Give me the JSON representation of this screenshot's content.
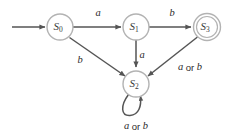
{
  "diagram": {
    "type": "finite-state-machine",
    "title": "",
    "canvas": {
      "width": 231,
      "height": 137,
      "background": "#ffffff"
    },
    "colors": {
      "state_stroke": "#b3b3b3",
      "state_fill": "#ffffff",
      "edge_stroke": "#555555",
      "label_text": "#2b2b2b",
      "state_text": "#3a3a3a"
    },
    "states": [
      {
        "id": "S0",
        "base": "S",
        "subscript": "0",
        "cx": 60,
        "cy": 27,
        "r": 13,
        "accepting": false,
        "start": true
      },
      {
        "id": "S1",
        "base": "S",
        "subscript": "1",
        "cx": 136,
        "cy": 27,
        "r": 13,
        "accepting": false,
        "start": false
      },
      {
        "id": "S3",
        "base": "S",
        "subscript": "3",
        "cx": 207,
        "cy": 27,
        "r": 13.5,
        "r_inner": 10.5,
        "accepting": true,
        "start": false
      },
      {
        "id": "S2",
        "base": "S",
        "subscript": "2",
        "cx": 136,
        "cy": 84,
        "r": 13,
        "accepting": false,
        "start": false
      }
    ],
    "start_arrow": {
      "name": "start-arrow",
      "from_x": 12,
      "from_y": 27,
      "to_x": 45,
      "to_y": 27
    },
    "transitions": [
      {
        "id": "t-s0-s1",
        "from": "S0",
        "to": "S1",
        "label": "a",
        "label_style": "italic",
        "label_x": 98,
        "label_y": 14
      },
      {
        "id": "t-s1-s3",
        "from": "S1",
        "to": "S3",
        "label": "b",
        "label_style": "italic",
        "label_x": 172,
        "label_y": 14
      },
      {
        "id": "t-s0-s2",
        "from": "S0",
        "to": "S2",
        "label": "b",
        "label_style": "italic",
        "label_x": 80,
        "label_y": 61
      },
      {
        "id": "t-s1-s2",
        "from": "S1",
        "to": "S2",
        "label": "a",
        "label_style": "italic",
        "label_x": 142,
        "label_y": 56
      },
      {
        "id": "t-s3-s2",
        "from": "S3",
        "to": "S2",
        "label": "a or b",
        "label_parts": [
          "a",
          " or ",
          "b"
        ],
        "label_style": "mixed",
        "label_x": 190,
        "label_y": 68
      },
      {
        "id": "t-s2-s2",
        "from": "S2",
        "to": "S2",
        "label": "a or b",
        "label_parts": [
          "a",
          " or ",
          "b"
        ],
        "label_style": "mixed",
        "label_x": 136,
        "label_y": 127,
        "self_loop": true
      }
    ]
  }
}
